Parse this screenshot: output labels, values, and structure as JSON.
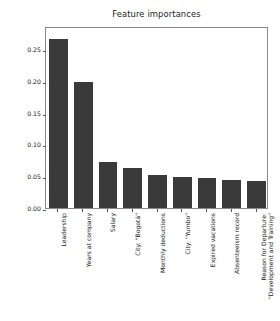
{
  "chart_data": {
    "type": "bar",
    "title": "Feature importances",
    "xlabel": "",
    "ylabel": "Importance",
    "categories": [
      "Leadership",
      "Years at company",
      "Salary",
      "City: \"Bogotá\"",
      "Monthly deductions",
      "City: \"Yumbo\"",
      "Expired vacations",
      "Absenteeism record",
      "Reason for Departure: \"Development and Training\""
    ],
    "category_lines": [
      [
        "Leadership"
      ],
      [
        "Years at company"
      ],
      [
        "Salary"
      ],
      [
        "City: \"Bogotá\""
      ],
      [
        "Monthly deductions"
      ],
      [
        "City: \"Yumbo\""
      ],
      [
        "Expired vacations"
      ],
      [
        "Absenteeism record"
      ],
      [
        "Reason for Departure:",
        "\"Development and Training\""
      ]
    ],
    "values": [
      0.265,
      0.198,
      0.072,
      0.063,
      0.052,
      0.049,
      0.047,
      0.044,
      0.043
    ],
    "ylim": [
      0.0,
      0.2861
    ],
    "yticks": [
      0.0,
      0.05,
      0.1,
      0.15,
      0.2,
      0.25
    ],
    "ytick_labels": [
      "0.00",
      "0.05",
      "0.10",
      "0.15",
      "0.20",
      "0.25"
    ],
    "grid": false,
    "legend": null,
    "bar_color": "#3a3a3a",
    "background_color": "#ffffff",
    "axis_color": "#888888",
    "text_color": "#1a1a1a"
  }
}
